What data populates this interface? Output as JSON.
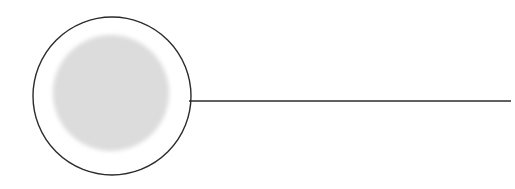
{
  "canvas": {
    "width": 515,
    "height": 189,
    "background_color": "#ffffff"
  },
  "figure": {
    "stroke_color": "#2b2b2b",
    "fill_color": "#ffffff",
    "disc_color": "#dcdcdc"
  },
  "shapes": {
    "outer_circle": {
      "name": "outer-circle",
      "cx": 112,
      "cy": 96,
      "r": 79,
      "stroke": "#2b2b2b",
      "stroke_width": 1.4,
      "fill": "#ffffff"
    },
    "inner_disc": {
      "name": "inner-gray-disc",
      "cx": 111,
      "cy": 93,
      "r": 58,
      "fill": "#dcdcdc",
      "blur": 2.2
    },
    "stem_line": {
      "name": "horizontal-stem-line",
      "x1": 189,
      "y1": 101,
      "x2": 511,
      "y2": 101,
      "stroke": "#2b2b2b",
      "stroke_width": 1.5
    }
  }
}
